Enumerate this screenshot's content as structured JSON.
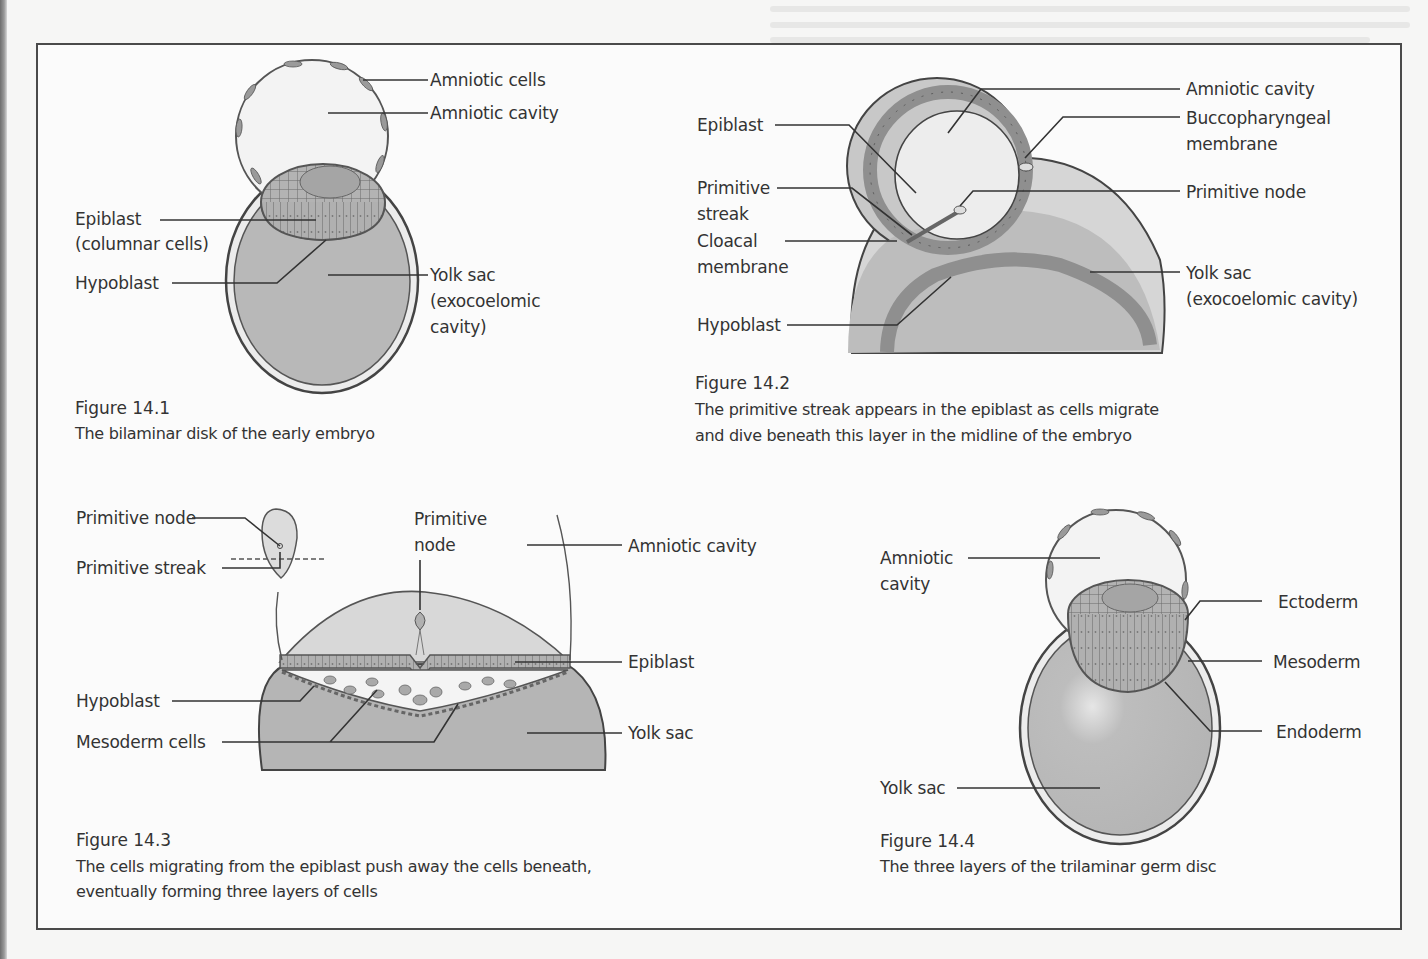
{
  "page": {
    "figures": [
      {
        "id": "fig-14-1",
        "number": "Figure 14.1",
        "caption": "The bilaminar disk of the early embryo",
        "labels": {
          "amniotic_cells": "Amniotic cells",
          "amniotic_cavity": "Amniotic cavity",
          "epiblast": "Epiblast",
          "epiblast_sub": "(columnar cells)",
          "hypoblast": "Hypoblast",
          "yolk_sac": "Yolk sac",
          "yolk_sac_sub1": "(exocoelomic",
          "yolk_sac_sub2": "cavity)"
        }
      },
      {
        "id": "fig-14-2",
        "number": "Figure 14.2",
        "caption_line1": "The primitive streak appears in the epiblast as cells migrate",
        "caption_line2": "and dive beneath this layer in the midline of the embryo",
        "labels": {
          "epiblast": "Epiblast",
          "primitive_streak1": "Primitive",
          "primitive_streak2": "streak",
          "cloacal1": "Cloacal",
          "cloacal2": "membrane",
          "hypoblast": "Hypoblast",
          "amniotic_cavity": "Amniotic cavity",
          "buccopharyngeal1": "Buccopharyngeal",
          "buccopharyngeal2": "membrane",
          "primitive_node": "Primitive node",
          "yolk_sac": "Yolk sac",
          "yolk_sac_sub": "(exocoelomic cavity)"
        }
      },
      {
        "id": "fig-14-3",
        "number": "Figure 14.3",
        "caption_line1": "The cells migrating from the epiblast push away the cells beneath,",
        "caption_line2": "eventually forming three layers of cells",
        "labels": {
          "primitive_node_inset": "Primitive node",
          "primitive_streak_inset": "Primitive streak",
          "primitive_node1": "Primitive",
          "primitive_node2": "node",
          "amniotic_cavity": "Amniotic cavity",
          "epiblast": "Epiblast",
          "hypoblast": "Hypoblast",
          "mesoderm_cells": "Mesoderm cells",
          "yolk_sac": "Yolk sac"
        }
      },
      {
        "id": "fig-14-4",
        "number": "Figure 14.4",
        "caption": "The three layers of the trilaminar germ disc",
        "labels": {
          "amniotic1": "Amniotic",
          "amniotic2": "cavity",
          "ectoderm": "Ectoderm",
          "mesoderm": "Mesoderm",
          "endoderm": "Endoderm",
          "yolk_sac": "Yolk sac"
        }
      }
    ],
    "colors": {
      "page_bg": "#f6f6f5",
      "frame": "#4a4a4a",
      "yolk_fill": "#b9b9b9",
      "amnion_fill": "#f0f0f0",
      "cell_fill": "#a9a9a9",
      "line": "#4f4f4f"
    }
  }
}
